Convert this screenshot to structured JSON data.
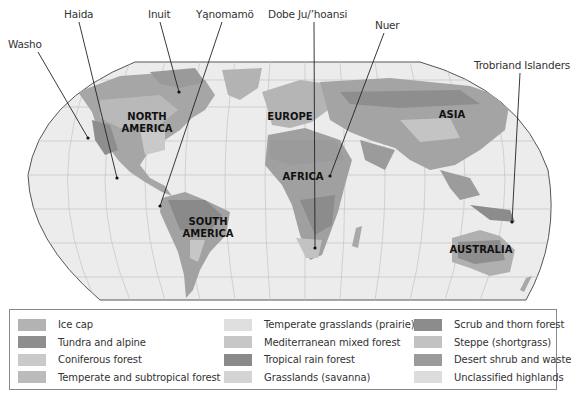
{
  "figure": {
    "map_type": "Robinson-style world projection, grayscale"
  },
  "annotations": [
    {
      "label": "Washo",
      "x": 8,
      "y": 40,
      "target": [
        88,
        138
      ]
    },
    {
      "label": "Haida",
      "x": 64,
      "y": 11,
      "target": [
        117,
        178
      ]
    },
    {
      "label": "Inuit",
      "x": 148,
      "y": 11,
      "target": [
        179,
        92
      ]
    },
    {
      "label": "Yąnomamö",
      "x": 196,
      "y": 11,
      "target": [
        160,
        206
      ]
    },
    {
      "label": "Dobe Ju/’hoansi",
      "x": 268,
      "y": 11,
      "target": [
        315,
        248
      ]
    },
    {
      "label": "Nuer",
      "x": 377,
      "y": 22,
      "target": [
        330,
        176
      ]
    },
    {
      "label": "Trobriand Islanders",
      "x": 474,
      "y": 62,
      "target": [
        512,
        222
      ]
    }
  ],
  "continents": [
    {
      "label_line1": "NORTH",
      "label_line2": "AMERICA",
      "x": 147,
      "y": 120
    },
    {
      "label_line1": "EUROPE",
      "label_line2": "",
      "x": 290,
      "y": 120
    },
    {
      "label_line1": "ASIA",
      "label_line2": "",
      "x": 452,
      "y": 118
    },
    {
      "label_line1": "AFRICA",
      "label_line2": "",
      "x": 303,
      "y": 180
    },
    {
      "label_line1": "SOUTH",
      "label_line2": "AMERICA",
      "x": 208,
      "y": 225
    },
    {
      "label_line1": "AUSTRALIA",
      "label_line2": "",
      "x": 461,
      "y": 253
    }
  ],
  "legend": {
    "columns": [
      [
        {
          "label": "Ice cap",
          "color": "#b3b3b3"
        },
        {
          "label": "Tundra and alpine",
          "color": "#8e8e8e"
        },
        {
          "label": "Coniferous forest",
          "color": "#c9c9c9"
        },
        {
          "label": "Temperate and subtropical forest",
          "color": "#bbbbbb"
        }
      ],
      [
        {
          "label": "Temperate grasslands (prairie)",
          "color": "#dedede"
        },
        {
          "label": "Mediterranean mixed forest",
          "color": "#c7c7c7"
        },
        {
          "label": "Tropical rain forest",
          "color": "#8a8a8a"
        },
        {
          "label": "Grasslands (savanna)",
          "color": "#d4d4d4"
        }
      ],
      [
        {
          "label": "Scrub and thorn forest",
          "color": "#8c8c8c"
        },
        {
          "label": "Steppe (shortgrass)",
          "color": "#c2c2c2"
        },
        {
          "label": "Desert shrub and waste",
          "color": "#9b9b9b"
        },
        {
          "label": "Unclassified highlands",
          "color": "#dcdcdc"
        }
      ]
    ]
  },
  "colors": {
    "ocean": "#ececec",
    "graticule": "#c4c4c4",
    "border": "#555555",
    "land_light": "#b8b8b8",
    "land_mid": "#a2a2a2",
    "land_dark": "#8a8a8a"
  }
}
